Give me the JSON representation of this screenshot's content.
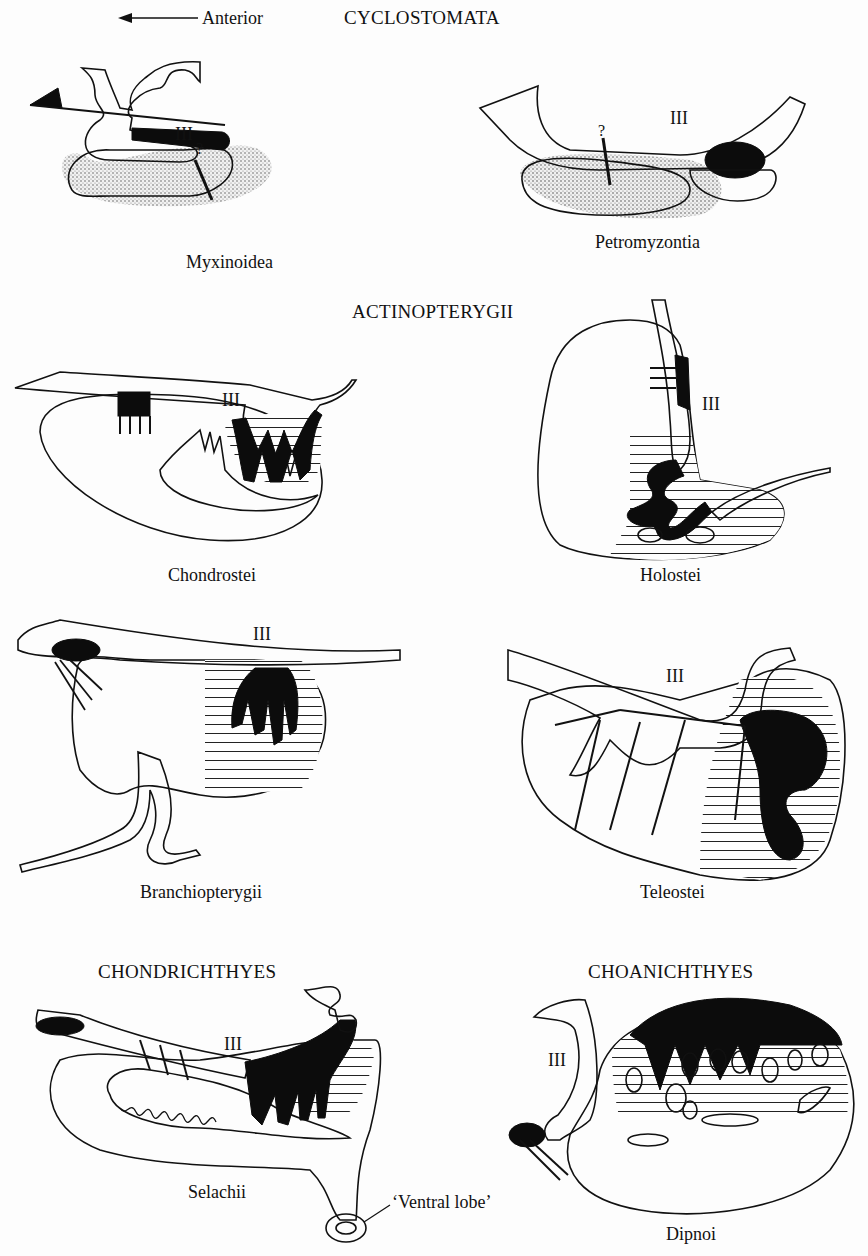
{
  "figure": {
    "orientation": {
      "arrow_label": "Anterior",
      "arrow_direction": "left"
    },
    "legend_patterns": {
      "stipple": "neural tissue / infundibulum (dotted)",
      "circles": "pars distalis (rostral/proximal, open circles)",
      "hatched": "pars intermedia (horizontal lines)",
      "black": "neurohypophysis (solid black)"
    },
    "ventricle_label": "III",
    "groups": [
      {
        "name": "CYCLOSTOMATA",
        "taxa": [
          "Myxinoidea",
          "Petromyzontia"
        ]
      },
      {
        "name": "ACTINOPTERYGII",
        "taxa": [
          "Chondrostei",
          "Holostei",
          "Branchiopterygii",
          "Teleostei"
        ]
      },
      {
        "name": "CHONDRICHTHYES",
        "taxa": [
          "Selachii"
        ]
      },
      {
        "name": "CHOANICHTHYES",
        "taxa": [
          "Dipnoi"
        ]
      }
    ],
    "annotations": {
      "question_mark": "?",
      "ventral_lobe": "‘Ventral lobe’"
    }
  },
  "labels": {
    "anterior": "Anterior",
    "cyclostomata": "CYCLOSTOMATA",
    "actinopterygii": "ACTINOPTERYGII",
    "chondrichthyes": "CHONDRICHTHYES",
    "choanichthyes": "CHOANICHTHYES",
    "myxinoidea": "Myxinoidea",
    "petromyzontia": "Petromyzontia",
    "chondrostei": "Chondrostei",
    "holostei": "Holostei",
    "branchiopterygii": "Branchiopterygii",
    "teleostei": "Teleostei",
    "selachii": "Selachii",
    "dipnoi": "Dipnoi",
    "ventral_lobe": "‘Ventral lobe’",
    "iii": "III",
    "q": "?"
  },
  "colors": {
    "ink": "#111111",
    "paper": "#fdfdfd"
  }
}
